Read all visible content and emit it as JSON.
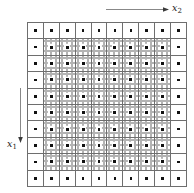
{
  "figure": {
    "type": "lattice-grid-diagram",
    "grid": {
      "rows": 10,
      "columns": 10,
      "outer_ring_style": "plain-white-cell-with-center-dot",
      "interior_style": "fine-dotted-subgrid-with-center-dot",
      "cell_border_color": "#6e6e6e",
      "subgrid_dot_color": "#9a9a9a",
      "marker_color": "#111111"
    },
    "axes": [
      {
        "id": "x2",
        "label": "x",
        "subscript": "2",
        "direction": "right",
        "position": "top",
        "arrow": "horizontal-right-arrow"
      },
      {
        "id": "x1",
        "label": "x",
        "subscript": "1",
        "direction": "down",
        "position": "left",
        "arrow": "vertical-down-arrow"
      }
    ]
  }
}
